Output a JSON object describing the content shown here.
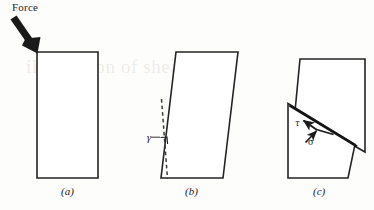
{
  "figure": {
    "domain": "diagram",
    "caption_labels": {
      "panel_a": "(a)",
      "panel_b": "(b)",
      "panel_c": "(c)"
    },
    "annotations": {
      "force": "Force",
      "shear_strain_symbol": "γ",
      "shear_stress_symbol": "τ",
      "normal_stress_symbol": "σ"
    },
    "ghost_text": "illustration of shear stress",
    "colors": {
      "ink": "#1c1c1c",
      "outline": "#242424",
      "page": "#fdfdfc",
      "arrow_fill": "#1a1a1a"
    }
  },
  "panels": [
    {
      "id": "a",
      "label": "(a)",
      "description": "Undeformed rectangular block with applied force arrow at top-left corner",
      "shape": "rectangle",
      "vertices": [
        [
          37,
          52
        ],
        [
          98,
          52
        ],
        [
          98,
          178
        ],
        [
          37,
          178
        ]
      ],
      "force_arrow": {
        "label": "Force",
        "from": [
          9,
          18
        ],
        "to": [
          37,
          52
        ],
        "direction": "down-right"
      }
    },
    {
      "id": "b",
      "label": "(b)",
      "description": "Sheared block forming a parallelogram; dashed vertical reference line and shear strain angle gamma",
      "shape": "parallelogram",
      "vertices": [
        [
          176,
          52
        ],
        [
          238,
          52
        ],
        [
          223,
          178
        ],
        [
          161,
          178
        ]
      ],
      "reference_line": {
        "style": "dashed",
        "from": [
          162,
          100
        ],
        "to": [
          168,
          178
        ]
      },
      "angle_label": "γ"
    },
    {
      "id": "c",
      "label": "(c)",
      "description": "Block failed along an inclined fracture plane; upper block offset right, lower block offset left, with shear stress tau along the plane and normal stress sigma into the plane",
      "upper_block_vertices": [
        [
          300,
          59
        ],
        [
          365,
          59
        ],
        [
          365,
          152
        ],
        [
          295,
          112
        ]
      ],
      "lower_block_vertices": [
        [
          288,
          104
        ],
        [
          355,
          145
        ],
        [
          348,
          178
        ],
        [
          288,
          178
        ]
      ],
      "stress_arrows": [
        {
          "symbol": "τ",
          "name": "shear-stress",
          "from": [
            316,
            129
          ],
          "to": [
            301,
            119
          ],
          "along": "fracture-plane"
        },
        {
          "symbol": "σ",
          "name": "normal-stress",
          "from": [
            306,
            141
          ],
          "to": [
            318,
            130
          ],
          "along": "into-plane"
        },
        {
          "symbol": "",
          "name": "resultant-traction",
          "from": [
            316,
            129
          ],
          "to": [
            334,
            134
          ],
          "along": "fracture-plane"
        }
      ]
    }
  ]
}
